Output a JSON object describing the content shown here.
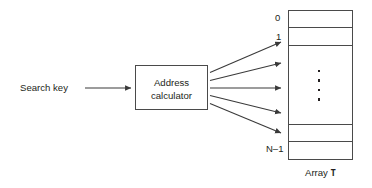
{
  "diagram": {
    "input_label": "Search key",
    "processor": {
      "line1": "Address",
      "line2": "calculator",
      "name": "address-calculator-box"
    },
    "array": {
      "caption_prefix": "Array",
      "caption_symbol": "T",
      "index_first": "0",
      "index_second": "1",
      "index_last": "N–1",
      "vertical_ellipsis": "⋮",
      "slot_count_visible": 5
    },
    "arrows": {
      "input_arrow_count": 1,
      "fanout_arrow_count": 5
    },
    "colors": {
      "stroke": "#4a4a4a",
      "text": "#231f20",
      "background": "#ffffff",
      "arrow": "#3a3a3a"
    }
  }
}
